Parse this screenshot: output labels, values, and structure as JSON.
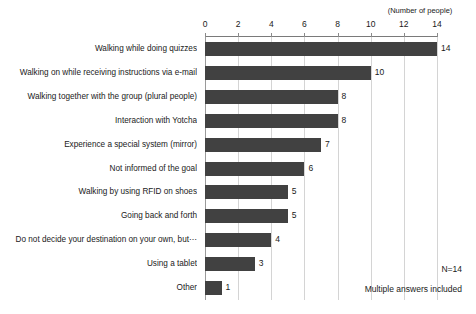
{
  "chart_data": {
    "type": "bar",
    "orientation": "horizontal",
    "title": "",
    "subtitle": "",
    "xlabel": "(Number of people)",
    "ylabel": "",
    "xlim": [
      0,
      14
    ],
    "xticks": [
      0,
      2,
      4,
      6,
      8,
      10,
      12,
      14
    ],
    "xtick_labels": [
      "0",
      "2",
      "4",
      "6",
      "8",
      "10",
      "12",
      "14"
    ],
    "grid": true,
    "legend": null,
    "categories": [
      "Walking while doing quizzes",
      "Walking on while receiving instructions via e-mail",
      "Walking together with the group (plural people)",
      "Interaction with Yotcha",
      "Experience a special system (mirror)",
      "Not informed of the goal",
      "Walking by using RFID on shoes",
      "Going back and forth",
      "Do not decide your destination on your own, but⋯",
      "Using a tablet",
      "Other"
    ],
    "values": [
      14,
      10,
      8,
      8,
      7,
      6,
      5,
      5,
      4,
      3,
      1
    ],
    "value_labels": [
      "14",
      "10",
      "8",
      "8",
      "7",
      "6",
      "5",
      "5",
      "4",
      "3",
      "1"
    ],
    "bar_color": "#414141",
    "gridline_color": "#d4d4d4",
    "axis_color": "#7a7a7a",
    "annotations": [
      "N=14",
      "Multiple answers included"
    ]
  },
  "footnotes": {
    "sample_size": "N=14",
    "multiple_answers": "Multiple answers included"
  },
  "axis": {
    "unit_caption": "(Number of people)"
  }
}
